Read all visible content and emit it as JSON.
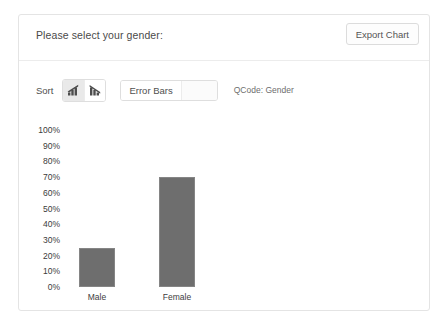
{
  "panel": {
    "title": "Please select your gender:",
    "export_button_label": "Export Chart"
  },
  "toolbar": {
    "sort_label": "Sort",
    "sort_ascending_icon": "bar-chart-ascending-icon",
    "sort_descending_icon": "bar-chart-descending-icon",
    "sort_selected": "ascending",
    "error_bars_label": "Error Bars",
    "error_bars_value": "",
    "qcode_text": "QCode: Gender"
  },
  "colors": {
    "bar_fill": "#6e6e6e",
    "bar_stroke": "#858585",
    "panel_border": "#e4e4e4",
    "text": "#4a4a4a"
  },
  "chart_data": {
    "type": "bar",
    "title": "Please select your gender:",
    "xlabel": "",
    "ylabel": "",
    "categories": [
      "Male",
      "Female"
    ],
    "values": [
      25,
      70
    ],
    "value_unit": "%",
    "ylim": [
      0,
      100
    ],
    "yticks": [
      "100%",
      "90%",
      "80%",
      "70%",
      "60%",
      "50%",
      "40%",
      "30%",
      "20%",
      "10%",
      "0%"
    ],
    "ytick_values": [
      100,
      90,
      80,
      70,
      60,
      50,
      40,
      30,
      20,
      10,
      0
    ],
    "grid": false,
    "legend": false,
    "error_bars": false,
    "series": [
      {
        "name": "Gender",
        "values": [
          25,
          70
        ]
      }
    ]
  }
}
